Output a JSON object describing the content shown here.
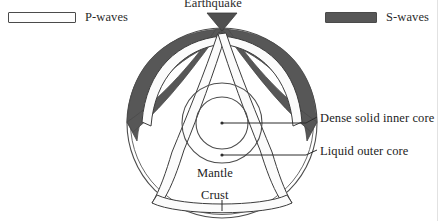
{
  "legend": {
    "p_waves": {
      "label": "P-waves",
      "swatch_icon": "legend-swatch-light",
      "color": "#fdfdfd"
    },
    "s_waves": {
      "label": "S-waves",
      "swatch_icon": "legend-swatch-dark",
      "color": "#575757"
    }
  },
  "diagram": {
    "title_label": "Earthquake",
    "focus_marker_icon": "triangle-down-icon",
    "labels": {
      "inner_core": "Dense solid inner core",
      "outer_core": "Liquid outer core",
      "mantle": "Mantle",
      "crust": "Crust"
    },
    "colors": {
      "s_wave": "#575757",
      "p_wave_fill": "#fbfbfb",
      "outline": "#3c3c3c",
      "circle_line": "#4d4d4d",
      "leader_line": "#2d2d2d",
      "background": "#ffffff"
    },
    "geometry": {
      "center_x": 222,
      "center_y": 123,
      "crust_radius": 95,
      "outer_core_radius": 40,
      "inner_core_radius": 26,
      "focus_x": 222,
      "focus_y": 28
    }
  }
}
